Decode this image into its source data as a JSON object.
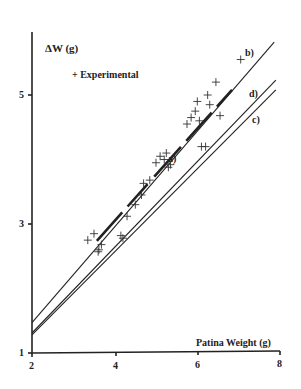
{
  "chart_data": {
    "type": "scatter",
    "title": "",
    "xlabel": "Patina Weight (g)",
    "ylabel": "ΔW (g)",
    "xlim": [
      2,
      8
    ],
    "ylim": [
      1,
      6
    ],
    "x_ticks": [
      "2",
      "4",
      "6",
      "8"
    ],
    "y_ticks": [
      "1",
      "3",
      "5"
    ],
    "grid": false,
    "legend": {
      "entries": [
        "+ Experimental"
      ],
      "position": "upper-left"
    },
    "series": [
      {
        "name": "Experimental",
        "marker": "+",
        "points": [
          [
            3.35,
            2.75
          ],
          [
            3.5,
            2.85
          ],
          [
            3.6,
            2.57
          ],
          [
            3.68,
            2.68
          ],
          [
            3.62,
            2.6
          ],
          [
            4.15,
            2.82
          ],
          [
            4.2,
            2.78
          ],
          [
            4.3,
            3.12
          ],
          [
            4.5,
            3.3
          ],
          [
            4.65,
            3.45
          ],
          [
            4.7,
            3.63
          ],
          [
            4.85,
            3.68
          ],
          [
            5.0,
            3.95
          ],
          [
            5.1,
            4.05
          ],
          [
            5.2,
            4.0
          ],
          [
            5.25,
            4.1
          ],
          [
            5.3,
            3.88
          ],
          [
            5.35,
            3.92
          ],
          [
            5.75,
            4.55
          ],
          [
            5.85,
            4.65
          ],
          [
            5.95,
            4.75
          ],
          [
            6.0,
            4.9
          ],
          [
            6.05,
            4.6
          ],
          [
            6.1,
            4.2
          ],
          [
            6.2,
            4.2
          ],
          [
            6.25,
            5.0
          ],
          [
            6.3,
            4.85
          ],
          [
            6.55,
            4.68
          ],
          [
            6.45,
            5.2
          ],
          [
            7.05,
            5.55
          ]
        ]
      },
      {
        "name": "a)",
        "type": "line",
        "style": "thick-dashed",
        "points": [
          [
            3.57,
            2.74
          ],
          [
            6.84,
            5.08
          ]
        ]
      },
      {
        "name": "b)",
        "type": "line",
        "points": [
          [
            2,
            1.47
          ],
          [
            7.86,
            5.82
          ]
        ]
      },
      {
        "name": "d)",
        "type": "line",
        "points": [
          [
            2,
            1.31
          ],
          [
            7.9,
            5.23
          ]
        ]
      },
      {
        "name": "c)",
        "type": "line",
        "points": [
          [
            2,
            1.28
          ],
          [
            7.9,
            5.08
          ]
        ]
      }
    ],
    "annotations": [
      "a)",
      "b)",
      "c)",
      "d)"
    ]
  },
  "labels": {
    "ylabel": "ΔW (g)",
    "xlabel": "Patina Weight (g)",
    "legend": "+ Experimental",
    "line_a": "a)",
    "line_b": "b)",
    "line_c": "c)",
    "line_d": "d)",
    "xt0": "2",
    "xt1": "4",
    "xt2": "6",
    "xt3": "8",
    "yt0": "1",
    "yt1": "3",
    "yt2": "5"
  }
}
